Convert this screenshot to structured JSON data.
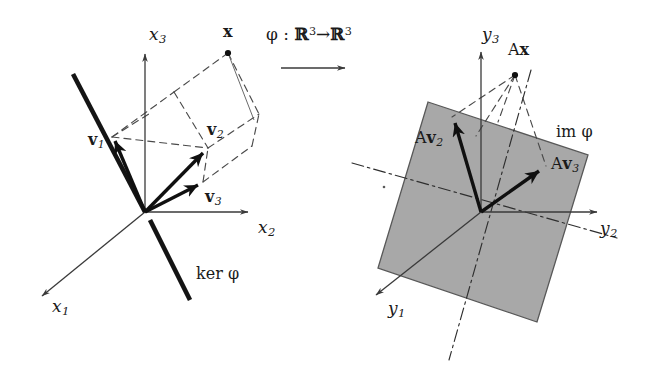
{
  "figure": {
    "background_color": "#ffffff",
    "ink_color": "#1a1a1a",
    "plane_fill_color": "#a8a8a8",
    "width": 648,
    "height": 368
  },
  "mapping": {
    "phi": "φ",
    "colon": ":",
    "domain": "ℝ",
    "domain_exponent": "3",
    "arrow": "→",
    "codomain": "ℝ",
    "codomain_exponent": "3"
  },
  "domain_diagram": {
    "axes": [
      {
        "name": "x1",
        "base": "x",
        "subscript": "1",
        "direction": "down-left"
      },
      {
        "name": "x2",
        "base": "x",
        "subscript": "2",
        "direction": "right"
      },
      {
        "name": "x3",
        "base": "x",
        "subscript": "3",
        "direction": "up"
      }
    ],
    "vectors": [
      {
        "name": "v1",
        "base": "v",
        "subscript": "1",
        "style": "bold-arrow"
      },
      {
        "name": "v2",
        "base": "v",
        "subscript": "2",
        "style": "bold-arrow"
      },
      {
        "name": "v3",
        "base": "v",
        "subscript": "3",
        "style": "bold-arrow"
      }
    ],
    "point": {
      "name": "x",
      "label": "x",
      "style": "bold-dot"
    },
    "kernel": {
      "label_prefix": "ker",
      "label_symbol": "φ",
      "style": "thick-line"
    },
    "construction": "dashed parallelepiped spanned by v1, v2, v3 with vertex at x"
  },
  "codomain_diagram": {
    "axes": [
      {
        "name": "y1",
        "base": "y",
        "subscript": "1",
        "direction": "down-left"
      },
      {
        "name": "y2",
        "base": "y",
        "subscript": "2",
        "direction": "right"
      },
      {
        "name": "y3",
        "base": "y",
        "subscript": "3",
        "direction": "up"
      }
    ],
    "vectors": [
      {
        "name": "Av2",
        "prefix": "A",
        "base": "v",
        "subscript": "2",
        "style": "bold-arrow"
      },
      {
        "name": "Av3",
        "prefix": "A",
        "base": "v",
        "subscript": "3",
        "style": "bold-arrow"
      }
    ],
    "point": {
      "name": "Ax",
      "prefix": "A",
      "label": "x",
      "style": "bold-dot"
    },
    "image": {
      "label_prefix": "im",
      "label_symbol": "φ",
      "style": "shaded-parallelogram"
    },
    "construction": "dashed projection lines from Ax to the image plane, dash-dot axes in the plane"
  }
}
